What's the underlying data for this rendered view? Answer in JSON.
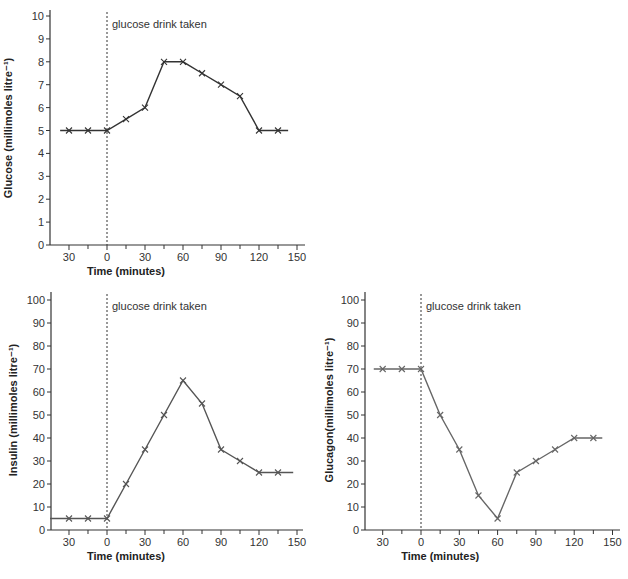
{
  "chart_data": [
    {
      "id": "glucose",
      "type": "line",
      "title": "",
      "xlabel": "Time (minutes)",
      "ylabel": "Glucose (millimoles litre⁻¹)",
      "annotation": "glucose drink taken",
      "annotation_x": 0,
      "xlim": [
        -40,
        150
      ],
      "ylim": [
        0,
        10
      ],
      "x_ticks": [
        -30,
        -15,
        0,
        15,
        30,
        45,
        60,
        75,
        90,
        105,
        120,
        135,
        150
      ],
      "x_tick_labels": [
        {
          "v": -30,
          "t": "30"
        },
        {
          "v": 0,
          "t": "0"
        },
        {
          "v": 30,
          "t": "30"
        },
        {
          "v": 60,
          "t": "60"
        },
        {
          "v": 90,
          "t": "90"
        },
        {
          "v": 120,
          "t": "120"
        },
        {
          "v": 150,
          "t": "150"
        }
      ],
      "y_ticks": [
        0,
        1,
        2,
        3,
        4,
        5,
        6,
        7,
        8,
        9,
        10
      ],
      "line_start_x": -37,
      "line_end_x": 143,
      "color": "#333333",
      "series": [
        {
          "name": "Glucose",
          "x": [
            -30,
            -15,
            0,
            15,
            30,
            45,
            60,
            75,
            90,
            105,
            120,
            135
          ],
          "values": [
            5,
            5,
            5,
            5.5,
            6,
            8,
            8,
            7.5,
            7,
            6.5,
            5,
            5
          ]
        }
      ]
    },
    {
      "id": "insulin",
      "type": "line",
      "title": "",
      "xlabel": "Time (minutes)",
      "ylabel": "Insulin (millimoles litre⁻¹)",
      "annotation": "glucose drink taken",
      "annotation_x": 0,
      "xlim": [
        -40,
        150
      ],
      "ylim": [
        0,
        100
      ],
      "x_ticks": [
        -30,
        -15,
        0,
        15,
        30,
        45,
        60,
        75,
        90,
        105,
        120,
        135,
        150
      ],
      "x_tick_labels": [
        {
          "v": -30,
          "t": "30"
        },
        {
          "v": 0,
          "t": "0"
        },
        {
          "v": 30,
          "t": "30"
        },
        {
          "v": 60,
          "t": "60"
        },
        {
          "v": 90,
          "t": "90"
        },
        {
          "v": 120,
          "t": "120"
        },
        {
          "v": 150,
          "t": "150"
        }
      ],
      "y_ticks": [
        0,
        10,
        20,
        30,
        40,
        50,
        60,
        70,
        80,
        90,
        100
      ],
      "line_start_x": -45,
      "line_end_x": 147,
      "color": "#555555",
      "series": [
        {
          "name": "Insulin",
          "x": [
            -30,
            -15,
            0,
            15,
            30,
            45,
            60,
            75,
            90,
            105,
            120,
            135
          ],
          "values": [
            5,
            5,
            5,
            20,
            35,
            50,
            65,
            55,
            35,
            30,
            25,
            25
          ]
        }
      ]
    },
    {
      "id": "glucagon",
      "type": "line",
      "title": "",
      "xlabel": "Time (minutes)",
      "ylabel": "Glucagon(millimoles litre⁻¹)",
      "annotation": "glucose drink taken",
      "annotation_x": 0,
      "xlim": [
        -40,
        150
      ],
      "ylim": [
        0,
        100
      ],
      "x_ticks": [
        -30,
        -15,
        0,
        15,
        30,
        45,
        60,
        75,
        90,
        105,
        120,
        135,
        150
      ],
      "x_tick_labels": [
        {
          "v": -30,
          "t": "30"
        },
        {
          "v": 0,
          "t": "0"
        },
        {
          "v": 30,
          "t": "30"
        },
        {
          "v": 60,
          "t": "60"
        },
        {
          "v": 90,
          "t": "90"
        },
        {
          "v": 120,
          "t": "120"
        },
        {
          "v": 150,
          "t": "150"
        }
      ],
      "y_ticks": [
        0,
        10,
        20,
        30,
        40,
        50,
        60,
        70,
        80,
        90,
        100
      ],
      "line_start_x": -37,
      "line_end_x": 142,
      "color": "#666666",
      "series": [
        {
          "name": "Glucagon",
          "x": [
            -30,
            -15,
            0,
            15,
            30,
            45,
            60,
            75,
            90,
            105,
            120,
            135
          ],
          "values": [
            70,
            70,
            70,
            50,
            35,
            15,
            5,
            25,
            30,
            35,
            40,
            40
          ]
        }
      ]
    }
  ],
  "layout": {
    "glucose": {
      "axis_x": 50,
      "x0": 107,
      "px_per_min": 1.2667,
      "y0": 245,
      "px_per_unit": 22.9,
      "axis_top": 10,
      "axis_right": 305,
      "xlabel_y": 275,
      "ylabel_cx": 12,
      "ylabel_cy": 128
    },
    "insulin": {
      "axis_x": 51,
      "x0": 107,
      "px_per_min": 1.2667,
      "y0": 530,
      "px_per_unit": 2.3,
      "axis_top": 292,
      "axis_right": 303,
      "xlabel_y": 560,
      "ylabel_cx": 17,
      "ylabel_cy": 410
    },
    "glucagon": {
      "axis_x": 365,
      "x0": 421,
      "px_per_min": 1.2767,
      "y0": 530,
      "px_per_unit": 2.3,
      "axis_top": 292,
      "axis_right": 620,
      "xlabel_y": 560,
      "ylabel_cx": 333,
      "ylabel_cy": 410
    }
  }
}
